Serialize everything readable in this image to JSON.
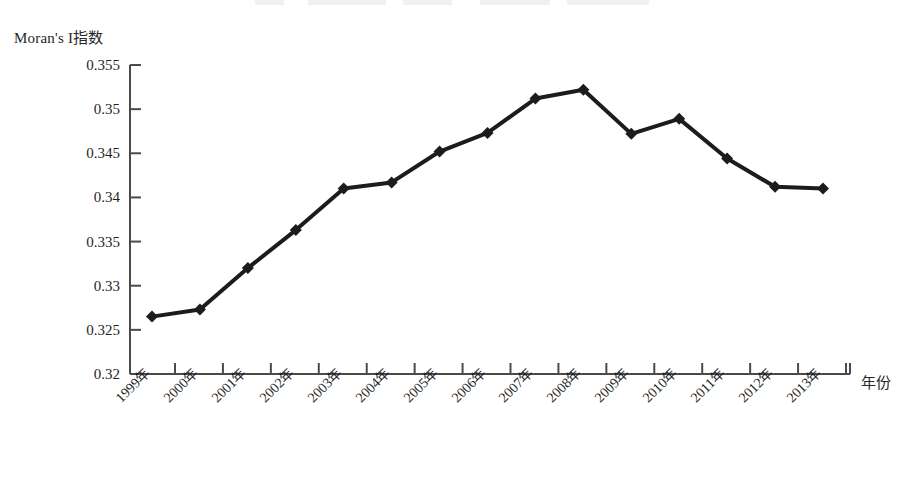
{
  "chart_data": {
    "type": "line",
    "title": "",
    "ylabel": "Moran's I指数",
    "xlabel": "年份",
    "categories": [
      "1999年",
      "2000年",
      "2001年",
      "2002年",
      "2003年",
      "2004年",
      "2005年",
      "2006年",
      "2007年",
      "2008年",
      "2009年",
      "2010年",
      "2011年",
      "2012年",
      "2013年"
    ],
    "x": [
      1999,
      2000,
      2001,
      2002,
      2003,
      2004,
      2005,
      2006,
      2007,
      2008,
      2009,
      2010,
      2011,
      2012,
      2013
    ],
    "values": [
      0.3265,
      0.3273,
      0.332,
      0.3363,
      0.341,
      0.3417,
      0.3452,
      0.3473,
      0.3512,
      0.3522,
      0.3472,
      0.3489,
      0.3444,
      0.3412,
      0.341
    ],
    "ylim": [
      0.32,
      0.355
    ],
    "yticks": [
      0.355,
      0.35,
      0.345,
      0.34,
      0.335,
      0.33,
      0.325,
      0.32
    ],
    "ytick_labels": [
      "0.355",
      "0.35",
      "0.345",
      "0.34",
      "0.335",
      "0.33",
      "0.325",
      "0.32"
    ],
    "grid": false,
    "legend": "none",
    "series_color": "#1c1c1c",
    "marker": "diamond",
    "axis_color": "#4a4a4a"
  }
}
